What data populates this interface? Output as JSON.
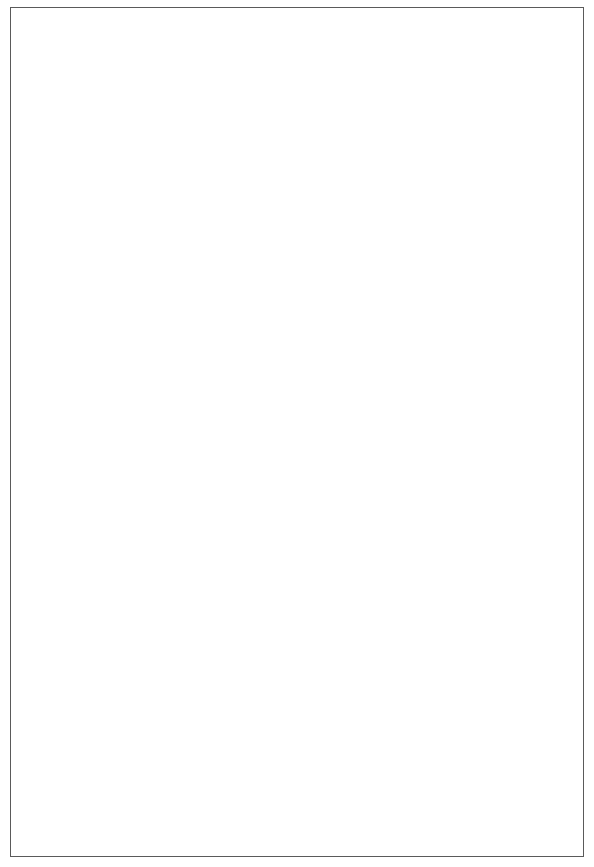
{
  "figure": {
    "border_color": "#5a5a5a",
    "background": "#ffffff"
  },
  "series_colors": {
    "1994": "#c6c6c6",
    "1995": "#1a1a1a",
    "1996": "#2d5699"
  },
  "legend": {
    "entries": [
      {
        "label": "1994",
        "color": "#c6c6c6",
        "width": 1.6
      },
      {
        "label": "1995",
        "color": "#1a1a1a",
        "width": 2.2
      },
      {
        "label": "1996",
        "color": "#2d5699",
        "width": 2.2
      }
    ]
  },
  "chart_data": [
    {
      "id": "top",
      "type": "line",
      "title": "",
      "xlabel": "",
      "ylabel": "Million Pounds",
      "categories": [
        "J",
        "F",
        "M",
        "A",
        "M",
        "J",
        "J",
        "A",
        "S",
        "O",
        "N",
        "D"
      ],
      "xticklabels": [
        "J",
        "F",
        "M",
        "A",
        "M",
        "J",
        "J",
        "A",
        "S",
        "O",
        "N",
        "D"
      ],
      "yticklabels": [
        "0",
        "500",
        "1,000",
        "1,500",
        "2,000",
        "2,500",
        "3,000",
        "3,500"
      ],
      "yticks": [
        0,
        500,
        1000,
        1500,
        2000,
        2500,
        3000,
        3500
      ],
      "ylim": [
        0,
        3500
      ],
      "grid": false,
      "legend_position": "bottom-right",
      "series": [
        {
          "name": "1994",
          "color": "#c6c6c6",
          "values": [
            2590,
            2410,
            2790,
            2650,
            2700,
            2810,
            2560,
            3040,
            2820,
            2840,
            2710,
            2720
          ]
        },
        {
          "name": "1995",
          "color": "#1a1a1a",
          "values": [
            2820,
            2590,
            3040,
            2640,
            3050,
            3080,
            2845,
            2995,
            2815,
            3060,
            2840,
            2765
          ]
        },
        {
          "name": "1996",
          "color": "#2d5699",
          "values": [
            3110,
            2965,
            2960,
            3010,
            3145,
            2830,
            3060,
            3110,
            2880,
            3310,
            null,
            null
          ]
        }
      ]
    },
    {
      "id": "bottom",
      "type": "line",
      "title": "",
      "xlabel": "Months",
      "ylabel": "Cents per Pound",
      "categories": [
        "J",
        "F",
        "M",
        "A",
        "M",
        "J",
        "J",
        "A",
        "S",
        "O",
        "N",
        "D"
      ],
      "xticklabels": [
        "J",
        "F",
        "M",
        "A",
        "M",
        "J",
        "J",
        "A",
        "S",
        "O",
        "N",
        "D"
      ],
      "yticklabels": [
        "0",
        "10",
        "20",
        "30",
        "40",
        "50",
        "60",
        "70",
        "80"
      ],
      "yticks": [
        0,
        10,
        20,
        30,
        40,
        50,
        60,
        70,
        80
      ],
      "ylim": [
        0,
        80
      ],
      "grid": false,
      "legend_position": "bottom-right",
      "series": [
        {
          "name": "1994",
          "color": "#c6c6c6",
          "values": [
            57.5,
            58.5,
            63.0,
            63.0,
            65.0,
            63.5,
            63.5,
            60.0,
            61.5,
            56.0,
            54.5,
            55.5
          ]
        },
        {
          "name": "1995",
          "color": "#1a1a1a",
          "values": [
            56.5,
            58.5,
            58.0,
            58.0,
            60.0,
            61.5,
            63.5,
            68.5,
            67.0,
            63.5,
            64.5,
            62.0
          ]
        },
        {
          "name": "1996",
          "color": "#2d5699",
          "values": [
            63.0,
            60.5,
            59.0,
            60.0,
            71.0,
            70.5,
            69.5,
            70.5,
            69.5,
            65.5,
            null,
            null
          ]
        }
      ]
    }
  ]
}
